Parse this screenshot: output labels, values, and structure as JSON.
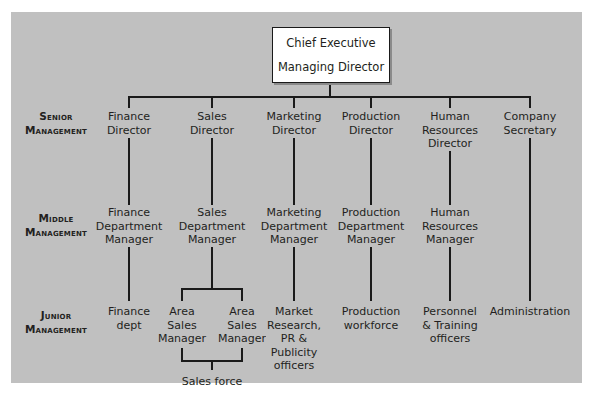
{
  "chart": {
    "top": {
      "line1": "Chief Executive",
      "line2": "Managing Director"
    },
    "levels": [
      {
        "line1": "Senior",
        "line2": "Management"
      },
      {
        "line1": "Middle",
        "line2": "Management"
      },
      {
        "line1": "Junior",
        "line2": "Management"
      }
    ],
    "columns": [
      {
        "senior": [
          "Finance",
          "Director"
        ],
        "middle": [
          "Finance",
          "Department",
          "Manager"
        ],
        "junior": [
          "Finance",
          "dept"
        ]
      },
      {
        "senior": [
          "Sales",
          "Director"
        ],
        "middle": [
          "Sales",
          "Department",
          "Manager"
        ],
        "junior_left": [
          "Area",
          "Sales",
          "Manager"
        ],
        "junior_right": [
          "Area",
          "Sales",
          "Manager"
        ],
        "below": "Sales force"
      },
      {
        "senior": [
          "Marketing",
          "Director"
        ],
        "middle": [
          "Marketing",
          "Department",
          "Manager"
        ],
        "junior": [
          "Market",
          "Research,",
          "PR &",
          "Publicity",
          "officers"
        ]
      },
      {
        "senior": [
          "Production",
          "Director"
        ],
        "middle": [
          "Production",
          "Department",
          "Manager"
        ],
        "junior": [
          "Production",
          "workforce"
        ]
      },
      {
        "senior": [
          "Human",
          "Resources",
          "Director"
        ],
        "middle": [
          "Human",
          "Resources",
          "Manager"
        ],
        "junior": [
          "Personnel",
          "& Training",
          "officers"
        ]
      },
      {
        "senior": [
          "Company",
          "Secretary"
        ],
        "junior": [
          "Administration"
        ]
      }
    ]
  },
  "colors": {
    "panel": "#c0c0c0",
    "lines": "#1a1a1a",
    "box": "#ffffff"
  }
}
